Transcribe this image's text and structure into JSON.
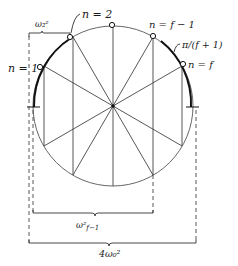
{
  "diagram": {
    "type": "circle-mode-construction",
    "colors": {
      "ink": "#1a1a1a",
      "line": "#555555",
      "background": "#ffffff"
    },
    "labels": {
      "n1": "n = 1",
      "n2": "n = 2",
      "nf1": "n = f − 1",
      "nf": "n = f",
      "angle": "π/(f + 1)",
      "omega2": "ω₂²",
      "omega_f1": "ω²",
      "omega_f1_sub": "f−1",
      "four_omega": "4ω₀²"
    }
  }
}
